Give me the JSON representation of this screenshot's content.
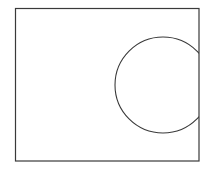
{
  "diagram": {
    "width": 208,
    "height": 170,
    "stroke_color": "#3a3a3a",
    "background": "#ffffff",
    "rectangle": {
      "shape": "rectangle",
      "x": 15.5,
      "y": 8.5,
      "width": 183.5,
      "height": 152.5
    },
    "circle": {
      "shape": "circle",
      "cx": 163,
      "cy": 85,
      "r": 48,
      "clipped_by": "rectangle"
    }
  }
}
